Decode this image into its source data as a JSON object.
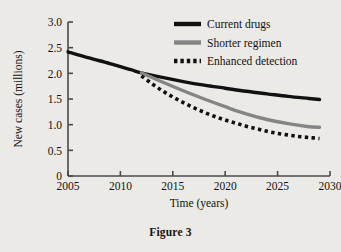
{
  "figure": {
    "caption": "Figure 3"
  },
  "chart_data": {
    "type": "line",
    "title": "",
    "xlabel": "Time (years)",
    "ylabel": "New cases (millions)",
    "xlim": [
      2005,
      2030
    ],
    "ylim": [
      0,
      3.0
    ],
    "xticks": [
      "2005",
      "2010",
      "2015",
      "2020",
      "2025",
      "2030"
    ],
    "yticks": [
      "0",
      "0.5",
      "1.0",
      "1.5",
      "2.0",
      "2.5",
      "3.0"
    ],
    "grid": false,
    "legend_position": "top-right",
    "colors": {
      "current_drugs": "#111111",
      "shorter_regimen": "#858585",
      "enhanced_detection": "#111111",
      "axis": "#4a4a4a",
      "background": "#eceae6"
    },
    "series": [
      {
        "name": "Current drugs",
        "style": "solid",
        "color": "#111111",
        "x": [
          2005,
          2007,
          2009,
          2011,
          2012,
          2014,
          2016,
          2018,
          2020,
          2022,
          2024,
          2026,
          2028,
          2029
        ],
        "values": [
          2.42,
          2.3,
          2.19,
          2.07,
          2.01,
          1.92,
          1.84,
          1.77,
          1.71,
          1.65,
          1.6,
          1.55,
          1.51,
          1.49
        ]
      },
      {
        "name": "Shorter regimen",
        "style": "solid",
        "color": "#858585",
        "x": [
          2012,
          2014,
          2016,
          2018,
          2020,
          2022,
          2024,
          2026,
          2028,
          2029
        ],
        "values": [
          2.01,
          1.83,
          1.66,
          1.5,
          1.35,
          1.21,
          1.1,
          1.02,
          0.96,
          0.95
        ]
      },
      {
        "name": "Enhanced detection",
        "style": "dotted",
        "color": "#111111",
        "x": [
          2012,
          2013,
          2014,
          2015,
          2016,
          2017,
          2018,
          2019,
          2020,
          2021,
          2022,
          2023,
          2024,
          2025,
          2026,
          2027,
          2028,
          2029
        ],
        "values": [
          1.95,
          1.8,
          1.66,
          1.54,
          1.43,
          1.33,
          1.24,
          1.16,
          1.09,
          1.03,
          0.97,
          0.92,
          0.87,
          0.83,
          0.8,
          0.77,
          0.75,
          0.73
        ]
      }
    ]
  }
}
